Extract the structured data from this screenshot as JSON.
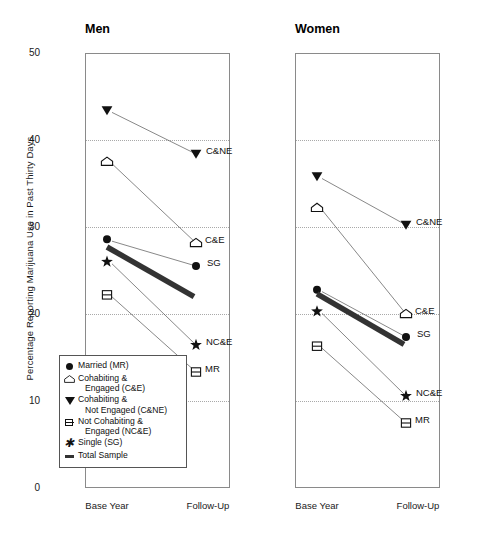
{
  "chart_data": {
    "type": "line",
    "title": "",
    "ylabel": "Percentage Reporting Marijuana Use in Past Thirty Days",
    "xlabel": "",
    "ylim": [
      0,
      50
    ],
    "yticks": [
      50,
      40,
      30,
      20,
      10,
      0
    ],
    "grid": "horizontal dotted at 10,20,30,40",
    "x": [
      "Base Year",
      "Follow-Up"
    ],
    "legend_position": "inside lower-left of Men panel",
    "panels": [
      {
        "name": "Men",
        "series": [
          {
            "name": "Cohabiting & Not Engaged (C&NE)",
            "short": "C&NE",
            "marker": "filled-triangle-down",
            "values": [
              43.4,
              38.4
            ]
          },
          {
            "name": "Cohabiting & Engaged (C&E)",
            "short": "C&E",
            "marker": "open-home-pentagon",
            "values": [
              37.5,
              28.2
            ]
          },
          {
            "name": "Married (MR)",
            "short": "MR",
            "marker": "filled-circle",
            "values": [
              28.6,
              11.5
            ]
          },
          {
            "name": "Single (SG)",
            "short": "SG",
            "marker": "star",
            "values": [
              26.0,
              25.5
            ]
          },
          {
            "name": "Not Cohabiting & Engaged (NC&E)",
            "short": "NC&E",
            "marker": "open-square-barred",
            "values": [
              22.2,
              16.4
            ]
          },
          {
            "name": "Total Sample",
            "short": "Total Sample",
            "marker": "thick-line",
            "values": [
              27.7,
              22.0
            ]
          }
        ]
      },
      {
        "name": "Women",
        "series": [
          {
            "name": "Cohabiting & Not Engaged (C&NE)",
            "short": "C&NE",
            "marker": "filled-triangle-down",
            "values": [
              35.8,
              28.7
            ]
          },
          {
            "name": "Cohabiting & Engaged (C&E)",
            "short": "C&E",
            "marker": "open-home-pentagon",
            "values": [
              32.2,
              21.5
            ]
          },
          {
            "name": "Married (MR)",
            "short": "MR",
            "marker": "filled-circle",
            "values": [
              22.8,
              10.8
            ]
          },
          {
            "name": "Single (SG)",
            "short": "SG",
            "marker": "star",
            "values": [
              20.3,
              18.5
            ]
          },
          {
            "name": "Not Cohabiting & Engaged (NC&E)",
            "short": "NC&E",
            "marker": "open-square-barred",
            "values": [
              16.3,
              13.3
            ]
          },
          {
            "name": "Total Sample",
            "short": "Total Sample",
            "marker": "thick-line",
            "values": [
              22.3,
              16.5
            ]
          }
        ]
      }
    ]
  },
  "panels": {
    "men": {
      "title": "Men"
    },
    "women": {
      "title": "Women"
    }
  },
  "axis": {
    "y_title": "Percentage Reporting Marijuana Use in Past Thirty Days",
    "y_labels": [
      "50",
      "40",
      "30",
      "20",
      "10",
      "0"
    ],
    "x_labels": [
      "Base Year",
      "Follow-Up"
    ]
  },
  "legend": {
    "items": [
      {
        "glyph": "filled-circle",
        "line1": "Married (MR)",
        "line2": ""
      },
      {
        "glyph": "open-home-pentagon",
        "line1": "Cohabiting &",
        "line2": "Engaged (C&E)"
      },
      {
        "glyph": "filled-triangle-down",
        "line1": "Cohabiting &",
        "line2": "Not Engaged (C&NE)"
      },
      {
        "glyph": "open-square-barred",
        "line1": "Not Cohabiting &",
        "line2": "Engaged (NC&E)"
      },
      {
        "glyph": "star",
        "line1": "Single (SG)",
        "line2": ""
      },
      {
        "glyph": "thick-line",
        "line1": "Total Sample",
        "line2": ""
      }
    ]
  },
  "end_labels": {
    "men": [
      "C&NE",
      "C&E",
      "SG",
      "NC&E",
      "MR"
    ],
    "women": [
      "C&NE",
      "C&E",
      "SG",
      "NC&E",
      "MR"
    ]
  },
  "colors": {
    "ink": "#111111",
    "axis": "#8a8a8a",
    "grid": "#a9a9a9",
    "total_sample": "#333333"
  }
}
